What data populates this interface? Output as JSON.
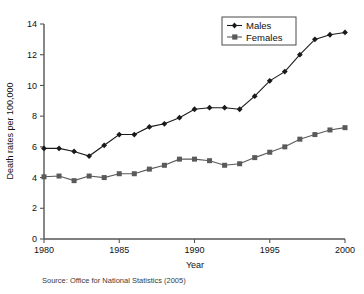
{
  "chart_data": {
    "type": "line",
    "title": "",
    "subtitle": "",
    "xlabel": "Year",
    "ylabel": "Death rates per 100,000",
    "xlim": [
      1980,
      2000
    ],
    "ylim": [
      0,
      14
    ],
    "xticks": [
      1980,
      1985,
      1990,
      1995,
      2000
    ],
    "yticks": [
      0,
      2,
      4,
      6,
      8,
      10,
      12,
      14
    ],
    "grid": false,
    "legend_position": "top-right",
    "x": [
      1980,
      1981,
      1982,
      1983,
      1984,
      1985,
      1986,
      1987,
      1988,
      1989,
      1990,
      1991,
      1992,
      1993,
      1994,
      1995,
      1996,
      1997,
      1998,
      1999,
      2000
    ],
    "series": [
      {
        "name": "Males",
        "marker": "diamond",
        "color": "#1a1a1a",
        "values": [
          5.9,
          5.9,
          5.7,
          5.4,
          6.1,
          6.8,
          6.8,
          7.3,
          7.5,
          7.9,
          8.45,
          8.55,
          8.55,
          8.45,
          9.3,
          10.3,
          10.9,
          12.0,
          13.0,
          13.3,
          13.45
        ]
      },
      {
        "name": "Females",
        "marker": "square",
        "color": "#5a5a5a",
        "values": [
          4.05,
          4.1,
          3.8,
          4.1,
          4.0,
          4.25,
          4.25,
          4.55,
          4.8,
          5.2,
          5.2,
          5.1,
          4.8,
          4.9,
          5.3,
          5.65,
          6.0,
          6.5,
          6.8,
          7.1,
          7.25
        ]
      }
    ],
    "annotations": []
  },
  "axes": {
    "x_title": "Year",
    "y_title": "Death rates per 100,000",
    "x_tick_labels": [
      "1980",
      "1985",
      "1990",
      "1995",
      "2000"
    ],
    "y_tick_labels": [
      "0",
      "2",
      "4",
      "6",
      "8",
      "10",
      "12",
      "14"
    ]
  },
  "legend": {
    "entries": [
      {
        "label": "Males"
      },
      {
        "label": "Females"
      }
    ]
  },
  "footer": {
    "source": "Source: Office for National Statistics (2005)"
  }
}
